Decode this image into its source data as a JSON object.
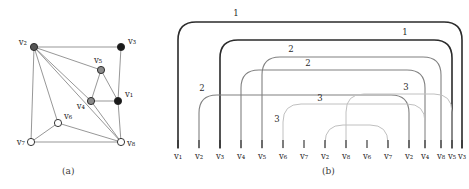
{
  "figure": {
    "panels": [
      {
        "id": "a",
        "caption": "(a)",
        "type": "graph-drawing"
      },
      {
        "id": "b",
        "caption": "(b)",
        "type": "arc-diagram"
      }
    ]
  },
  "chart_data": [
    {
      "type": "diagram",
      "panel": "a",
      "title": "(a)",
      "vertices": [
        {
          "id": "v1",
          "label": "v₁",
          "x": 118,
          "y": 101,
          "fill": "#1a1a1a",
          "label_dx": 7,
          "label_dy": -4,
          "anchor": "start"
        },
        {
          "id": "v2",
          "label": "v₂",
          "x": 34,
          "y": 47,
          "fill": "#555555",
          "label_dx": -7,
          "label_dy": -2,
          "anchor": "end"
        },
        {
          "id": "v3",
          "label": "v₃",
          "x": 121,
          "y": 47,
          "fill": "#1a1a1a",
          "label_dx": 7,
          "label_dy": -3,
          "anchor": "start"
        },
        {
          "id": "v4",
          "label": "v₄",
          "x": 91,
          "y": 101,
          "fill": "#8a8a8a",
          "label_dx": -6,
          "label_dy": 8,
          "anchor": "end"
        },
        {
          "id": "v5",
          "label": "v₅",
          "x": 101,
          "y": 70,
          "fill": "#8a8a8a",
          "label_dx": -3,
          "label_dy": -7,
          "anchor": "middle"
        },
        {
          "id": "v6",
          "label": "v₆",
          "x": 58,
          "y": 123,
          "fill": "#ffffff",
          "label_dx": 6,
          "label_dy": -4,
          "anchor": "start"
        },
        {
          "id": "v7",
          "label": "v₇",
          "x": 31,
          "y": 142,
          "fill": "#ffffff",
          "label_dx": -6,
          "label_dy": 3,
          "anchor": "end"
        },
        {
          "id": "v8",
          "label": "v₈",
          "x": 121,
          "y": 142,
          "fill": "#ffffff",
          "label_dx": 6,
          "label_dy": 4,
          "anchor": "start"
        }
      ],
      "edges": [
        [
          "v2",
          "v3"
        ],
        [
          "v2",
          "v7"
        ],
        [
          "v2",
          "v5"
        ],
        [
          "v2",
          "v4"
        ],
        [
          "v2",
          "v6"
        ],
        [
          "v2",
          "v8"
        ],
        [
          "v3",
          "v1"
        ],
        [
          "v5",
          "v1"
        ],
        [
          "v5",
          "v4"
        ],
        [
          "v4",
          "v1"
        ],
        [
          "v4",
          "v8"
        ],
        [
          "v1",
          "v8"
        ],
        [
          "v7",
          "v6"
        ],
        [
          "v7",
          "v8"
        ],
        [
          "v6",
          "v8"
        ]
      ],
      "vertex_radius": 3.6,
      "edge_color": "#6a6a6a",
      "grid": false,
      "legend": null
    },
    {
      "type": "diagram",
      "panel": "b",
      "title": "(b)",
      "spine_labels": [
        "v₁",
        "v₂",
        "v₃",
        "v₄",
        "v₅",
        "v₆",
        "v₇",
        "v₂",
        "v₈",
        "v₆",
        "v₇",
        "v₂",
        "v₄",
        "v₈",
        "v₅",
        "v₃"
      ],
      "spine_x": [
        178,
        199,
        220,
        241,
        262,
        283,
        304,
        325,
        346,
        367,
        388,
        409,
        425,
        441,
        452,
        462
      ],
      "baseline_y": 148,
      "arcs": [
        {
          "from": 0,
          "to": 15,
          "top": 22,
          "label": "1",
          "label_x": 236,
          "label_y": 16,
          "color": "#2b2b2b",
          "width": 1.6
        },
        {
          "from": 2,
          "to": 14,
          "top": 40,
          "label": "1",
          "label_x": 405,
          "label_y": 35,
          "color": "#2b2b2b",
          "width": 1.6
        },
        {
          "from": 4,
          "to": 13,
          "top": 57,
          "label": "2",
          "label_x": 291,
          "label_y": 52,
          "color": "#808080",
          "width": 1.1
        },
        {
          "from": 3,
          "to": 12,
          "top": 70,
          "label": "2",
          "label_x": 308,
          "label_y": 66,
          "color": "#808080",
          "width": 1.1
        },
        {
          "from": 1,
          "to": 11,
          "top": 95,
          "label": "2",
          "label_x": 202,
          "label_y": 91,
          "color": "#808080",
          "width": 1.1
        },
        {
          "from": 7,
          "to": 10,
          "top": 125,
          "label": "3",
          "label_x": 277,
          "label_y": 122,
          "color": "#c0c0c0",
          "width": 1.0
        },
        {
          "from": 5,
          "to": 12,
          "top": 104,
          "label": "3",
          "label_x": 320,
          "label_y": 101,
          "color": "#c0c0c0",
          "width": 1.0
        },
        {
          "from": 8,
          "to": 14,
          "top": 94,
          "label": "3",
          "label_x": 406,
          "label_y": 90,
          "color": "#c0c0c0",
          "width": 1.0
        }
      ],
      "tick_color": "#2b2b2b"
    }
  ]
}
